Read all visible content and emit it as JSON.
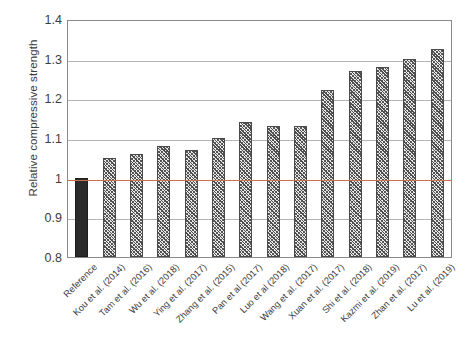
{
  "chart_data": {
    "type": "bar",
    "title": "",
    "subtitle": "",
    "xlabel": "",
    "ylabel": "Relative compressive strength",
    "ylim": [
      0.8,
      1.4
    ],
    "ytick_labels": [
      "1.4",
      "1.3",
      "1.2",
      "1.1",
      "1",
      "0.9",
      "0.8"
    ],
    "ytick_values": [
      1.4,
      1.3,
      1.2,
      1.1,
      1.0,
      0.9,
      0.8
    ],
    "grid": "horizontal",
    "legend": "none",
    "reference_line": 1.0,
    "reference_line_color": "#c8724a",
    "bar_fill_reference": "#2b2b2b",
    "bar_fill_studies": "#e9e9e9",
    "bar_edge_color": "#4a4a4a",
    "categories": [
      "Reference",
      "Kou et al. (2014)",
      "Tam et al. (2016)",
      "Wu et al. (2018)",
      "Ying et al. (2017)",
      "Zhang et al. (2015)",
      "Pan et al (2017)",
      "Luo et al (2018)",
      "Wang et al. (2017)",
      "Xuan et al. (2017)",
      "Shi et al. (2018)",
      "Kazmi et al. (2019)",
      "Zhan et al. (2017)",
      "Lu et al. (2019)"
    ],
    "values": [
      1.0,
      1.05,
      1.06,
      1.08,
      1.07,
      1.1,
      1.14,
      1.13,
      1.13,
      1.22,
      1.27,
      1.28,
      1.3,
      1.325
    ],
    "styles": [
      "solid",
      "hatched",
      "hatched",
      "hatched",
      "hatched",
      "hatched",
      "hatched",
      "hatched",
      "hatched",
      "hatched",
      "hatched",
      "hatched",
      "hatched",
      "hatched"
    ]
  }
}
